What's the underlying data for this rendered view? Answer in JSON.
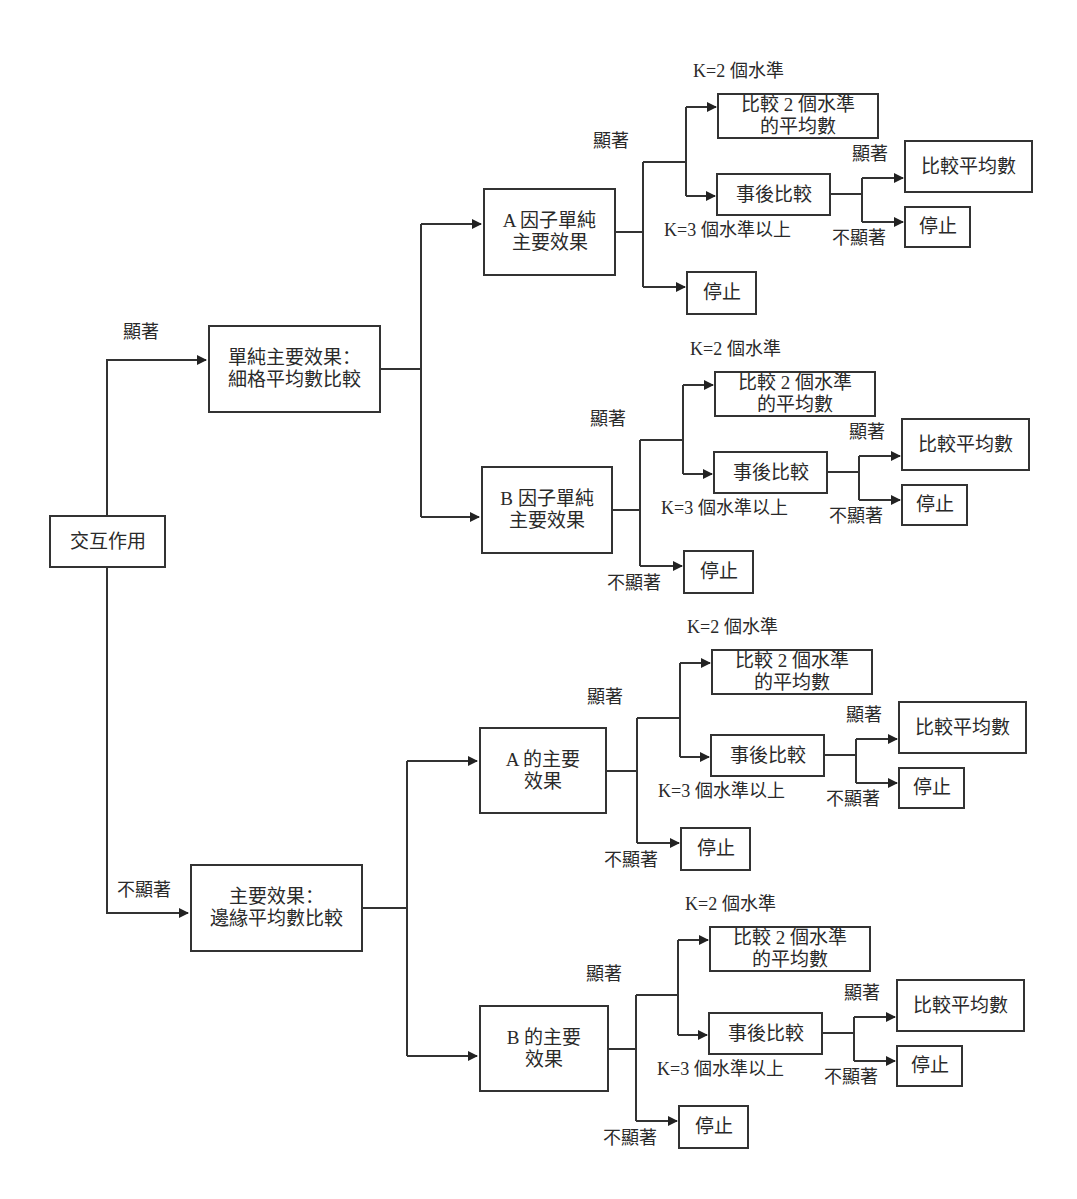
{
  "root": {
    "label": "交互作用"
  },
  "branches": {
    "significant": {
      "edge_label": "顯著",
      "node_label": "單純主要效果：\n細格平均數比較"
    },
    "not_significant": {
      "edge_label": "不顯著",
      "node_label": "主要效果：\n邊緣平均數比較"
    }
  },
  "labels": {
    "significant": "顯著",
    "not_significant": "不顯著",
    "k2": "K=2 個水準",
    "k3": "K=3 個水準以上",
    "compare_two": "比較 2 個水準\n的平均數",
    "post_hoc": "事後比較",
    "compare_means": "比較平均數",
    "stop": "停止"
  },
  "groups": [
    {
      "factor_label": "A 因子單純\n主要效果",
      "show_stop_label": false
    },
    {
      "factor_label": "B 因子單純\n主要效果",
      "show_stop_label": true
    },
    {
      "factor_label": "A 的主要\n效果",
      "show_stop_label": true
    },
    {
      "factor_label": "B 的主要\n效果",
      "show_stop_label": true
    }
  ],
  "colors": {
    "line": "#333333",
    "text": "#2a2a2a",
    "background": "#ffffff"
  }
}
